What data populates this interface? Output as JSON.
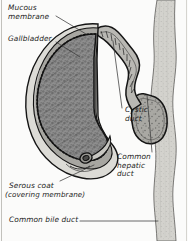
{
  "figure": {
    "style": "grayscale cutaway medical illustration",
    "background_color": "#fbfbfa",
    "frame_color": "#b9b9b4"
  },
  "labels": [
    {
      "id": "mucous-membrane",
      "text": "Mucous\nmembrane",
      "x": 8,
      "y": 6,
      "align": "left"
    },
    {
      "id": "gallbladder",
      "text": "Gallbladder",
      "x": 8,
      "y": 37,
      "align": "left"
    },
    {
      "id": "cystic-duct",
      "text": "Cystic\nduct",
      "x": 125,
      "y": 108,
      "align": "left"
    },
    {
      "id": "common-hepatic-duct",
      "text": "Common\nhepatic\nduct",
      "x": 117,
      "y": 155,
      "align": "left"
    },
    {
      "id": "serous-coat",
      "text": "Serous coat",
      "x": 9,
      "y": 184,
      "align": "left"
    },
    {
      "id": "serous-coat-sub",
      "text": "(covering membrane)",
      "x": 5,
      "y": 193,
      "align": "left"
    },
    {
      "id": "common-bile-duct",
      "text": "Common bile duct",
      "x": 9,
      "y": 218,
      "align": "left"
    }
  ],
  "colors": {
    "outline": "#1a1a1a",
    "mucosa_fill": "#8e8e8e",
    "mucosa_stipple": "#5e5e5e",
    "muscular_layer": "#9b9b9b",
    "serosa_fill": "#d9d8d3",
    "duct_lumen": "#ffffff",
    "duct_wall": "#c9c8c3",
    "hepatic_duct_fill": "#cfcec9",
    "leader_line": "#3a3a3a",
    "label_text": "#1d1d1d"
  },
  "leader_lines": [
    {
      "id": "mucous-membrane-leader",
      "from": [
        56,
        16
      ],
      "to": [
        84,
        33
      ]
    },
    {
      "id": "gallbladder-leader",
      "from": [
        56,
        42
      ],
      "to": [
        80,
        57
      ]
    },
    {
      "id": "cystic-duct-leader",
      "from": [
        123,
        110
      ],
      "to": [
        113,
        42
      ]
    },
    {
      "id": "common-hepatic-duct-leader",
      "from": [
        150,
        152
      ],
      "to": [
        146,
        96
      ]
    },
    {
      "id": "serous-coat-leader",
      "from": [
        60,
        182
      ],
      "to": [
        95,
        166
      ]
    },
    {
      "id": "common-bile-duct-leader",
      "from": [
        82,
        221
      ],
      "to": [
        158,
        221
      ]
    }
  ]
}
